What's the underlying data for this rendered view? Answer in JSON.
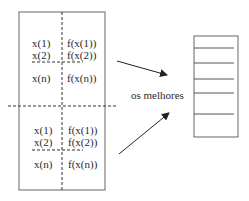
{
  "diagram": {
    "population_top": {
      "rows": [
        {
          "x": "x(1)",
          "fx": "f(x(1))"
        },
        {
          "x": "x(2)",
          "fx": "f(x(2))"
        },
        {
          "x": "x(n)",
          "fx": "f(x(n))"
        }
      ]
    },
    "population_bottom": {
      "rows": [
        {
          "x": "x(1)",
          "fx": "f(x(1))"
        },
        {
          "x": "x(2)",
          "fx": "f(x(2))"
        },
        {
          "x": "x(n)",
          "fx": "f(x(n))"
        }
      ]
    },
    "label_best": "os melhores",
    "stack_slots": 7,
    "colors": {
      "line": "#555555",
      "text": "#2a2a2a"
    }
  }
}
